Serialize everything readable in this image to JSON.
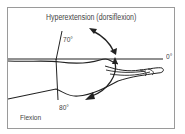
{
  "diagram": {
    "title": "Hyperextension (dorsiflexion)",
    "labels": {
      "hyperextension_angle": "70°",
      "neutral_angle": "0°",
      "flexion_angle": "80°",
      "flexion": "Flexion"
    },
    "colors": {
      "line": "#222222",
      "border": "#9a9a9a",
      "text": "#444444",
      "background": "#ffffff"
    }
  }
}
